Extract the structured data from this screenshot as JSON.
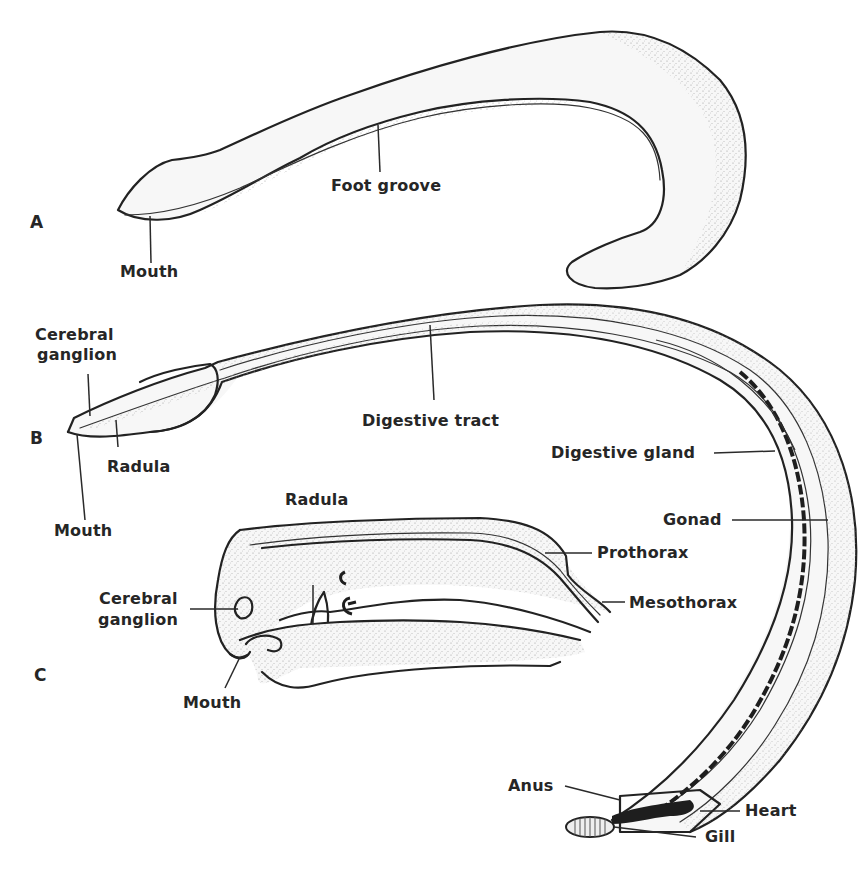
{
  "figure": {
    "panels": [
      {
        "id": "A",
        "label": "A",
        "labels": [
          {
            "key": "foot_groove",
            "text": "Foot groove"
          },
          {
            "key": "mouth",
            "text": "Mouth"
          }
        ]
      },
      {
        "id": "B",
        "label": "B",
        "labels": [
          {
            "key": "cerebral_ganglion_line1",
            "text": "Cerebral"
          },
          {
            "key": "cerebral_ganglion_line2",
            "text": "ganglion"
          },
          {
            "key": "radula",
            "text": "Radula"
          },
          {
            "key": "mouth",
            "text": "Mouth"
          },
          {
            "key": "digestive_tract",
            "text": "Digestive tract"
          },
          {
            "key": "digestive_gland",
            "text": "Digestive gland"
          },
          {
            "key": "gonad",
            "text": "Gonad"
          },
          {
            "key": "anus",
            "text": "Anus"
          },
          {
            "key": "heart",
            "text": "Heart"
          },
          {
            "key": "gill",
            "text": "Gill"
          }
        ]
      },
      {
        "id": "C",
        "label": "C",
        "labels": [
          {
            "key": "radula",
            "text": "Radula"
          },
          {
            "key": "cerebral_ganglion_line1",
            "text": "Cerebral"
          },
          {
            "key": "cerebral_ganglion_line2",
            "text": "ganglion"
          },
          {
            "key": "mouth",
            "text": "Mouth"
          },
          {
            "key": "prothorax",
            "text": "Prothorax"
          },
          {
            "key": "mesothorax",
            "text": "Mesothorax"
          }
        ]
      }
    ]
  },
  "colors": {
    "ink": "#222222",
    "background": "#ffffff",
    "stipple": "#9a9a9a"
  }
}
